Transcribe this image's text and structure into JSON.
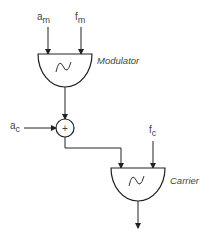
{
  "diagram": {
    "modulator": {
      "label": "Modulator",
      "inputs": [
        {
          "symbol": "a",
          "subscript": "m"
        },
        {
          "symbol": "f",
          "subscript": "m"
        }
      ]
    },
    "adder": {
      "symbol": "+",
      "input": {
        "symbol": "a",
        "subscript": "c"
      }
    },
    "carrier": {
      "label": "Carrier",
      "inputs": [
        {
          "symbol": "f",
          "subscript": "c"
        }
      ]
    },
    "colors": {
      "stroke": "#222222",
      "text": "#444444",
      "background": "#ffffff"
    }
  }
}
